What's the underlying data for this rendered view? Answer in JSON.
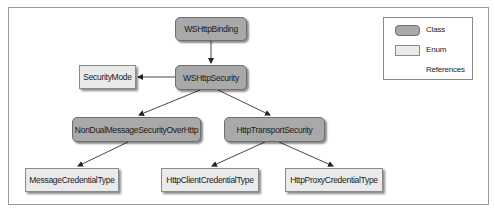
{
  "diagram": {
    "nodes": [
      {
        "id": "wshttpbinding",
        "label": "WSHttpBinding",
        "kind": "class"
      },
      {
        "id": "wshttpsecurity",
        "label": "WSHttpSecurity",
        "kind": "class"
      },
      {
        "id": "securitymode",
        "label": "SecurityMode",
        "kind": "enum"
      },
      {
        "id": "nondual",
        "label": "NonDualMessageSecurityOverHttp",
        "kind": "class"
      },
      {
        "id": "httptransport",
        "label": "HttpTransportSecurity",
        "kind": "class"
      },
      {
        "id": "messagecred",
        "label": "MessageCredentialType",
        "kind": "enum"
      },
      {
        "id": "httpclientcred",
        "label": "HttpClientCredentialType",
        "kind": "enum"
      },
      {
        "id": "httpproxycred",
        "label": "HttpProxyCredentialType",
        "kind": "enum"
      }
    ],
    "edges": [
      {
        "from": "WSHttpBinding",
        "to": "WSHttpSecurity",
        "type": "references"
      },
      {
        "from": "WSHttpSecurity",
        "to": "SecurityMode",
        "type": "references"
      },
      {
        "from": "WSHttpSecurity",
        "to": "NonDualMessageSecurityOverHttp",
        "type": "references"
      },
      {
        "from": "WSHttpSecurity",
        "to": "HttpTransportSecurity",
        "type": "references"
      },
      {
        "from": "NonDualMessageSecurityOverHttp",
        "to": "MessageCredentialType",
        "type": "references"
      },
      {
        "from": "HttpTransportSecurity",
        "to": "HttpClientCredentialType",
        "type": "references"
      },
      {
        "from": "HttpTransportSecurity",
        "to": "HttpProxyCredentialType",
        "type": "references"
      }
    ]
  },
  "legend": {
    "class_label": "Class",
    "enum_label": "Enum",
    "references_label": "References"
  },
  "colors": {
    "class_fill": "#a9a9a9",
    "enum_fill": "#eaeaea",
    "line": "#333333"
  }
}
